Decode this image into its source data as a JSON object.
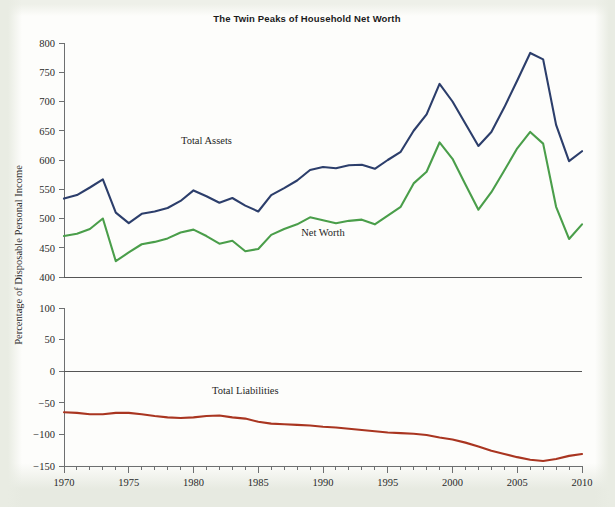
{
  "chart_data": {
    "type": "line",
    "title": "The Twin Peaks of Household Net Worth",
    "xlabel": "",
    "ylabel": "Percentage of Disposable Personal Income",
    "grid": false,
    "legend_position": "inline-annotations",
    "x": [
      1970,
      1971,
      1972,
      1973,
      1974,
      1975,
      1976,
      1977,
      1978,
      1979,
      1980,
      1981,
      1982,
      1983,
      1984,
      1985,
      1986,
      1987,
      1988,
      1989,
      1990,
      1991,
      1992,
      1993,
      1994,
      1995,
      1996,
      1997,
      1998,
      1999,
      2000,
      2001,
      2002,
      2003,
      2004,
      2005,
      2006,
      2007,
      2008,
      2009,
      2010
    ],
    "panels": [
      {
        "name": "upper-panel",
        "ylim": [
          400,
          800
        ],
        "yticks": [
          400,
          450,
          500,
          550,
          600,
          650,
          700,
          750,
          800
        ],
        "series": [
          {
            "name": "Total Assets",
            "color": "#2c3e6b",
            "label_x": 1981,
            "label_y": 628,
            "values": [
              534,
              540,
              553,
              567,
              510,
              492,
              508,
              512,
              518,
              530,
              548,
              538,
              527,
              535,
              522,
              512,
              540,
              552,
              565,
              583,
              588,
              586,
              591,
              592,
              585,
              600,
              614,
              650,
              678,
              730,
              700,
              662,
              624,
              648,
              690,
              736,
              783,
              772,
              660,
              598,
              615
            ],
            "annotations": [
              {
                "label": "1999 peak",
                "x": 1999,
                "y": 730
              },
              {
                "label": "2006 peak",
                "x": 2006,
                "y": 783
              }
            ]
          },
          {
            "name": "Net Worth",
            "color": "#4a9e4a",
            "label_x": 1990,
            "label_y": 470,
            "values": [
              470,
              474,
              482,
              500,
              427,
              442,
              456,
              460,
              466,
              476,
              481,
              470,
              457,
              462,
              444,
              448,
              472,
              482,
              490,
              502,
              497,
              492,
              496,
              498,
              490,
              505,
              520,
              560,
              580,
              630,
              602,
              558,
              515,
              545,
              582,
              620,
              648,
              628,
              520,
              465,
              490
            ],
            "annotations": [
              {
                "label": "1999 peak",
                "x": 1999,
                "y": 630
              },
              {
                "label": "2006 peak",
                "x": 2006,
                "y": 648
              }
            ]
          }
        ]
      },
      {
        "name": "lower-panel",
        "ylim": [
          -150,
          100
        ],
        "yticks": [
          -150,
          -100,
          -50,
          0,
          50,
          100
        ],
        "zero_line": 0,
        "series": [
          {
            "name": "Total Liabilities",
            "color": "#a93520",
            "label_x": 1984,
            "label_y": -36,
            "values": [
              -65,
              -66,
              -68,
              -68,
              -66,
              -66,
              -68,
              -71,
              -73,
              -74,
              -73,
              -71,
              -70,
              -73,
              -75,
              -80,
              -83,
              -84,
              -85,
              -86,
              -88,
              -89,
              -91,
              -93,
              -95,
              -97,
              -98,
              -99,
              -101,
              -105,
              -108,
              -113,
              -119,
              -126,
              -131,
              -136,
              -140,
              -142,
              -139,
              -134,
              -131
            ]
          }
        ]
      }
    ]
  },
  "geometry": {
    "plot_left": 64,
    "plot_right": 582,
    "upper_top": 43,
    "upper_bottom": 277,
    "lower_top": 308,
    "lower_bottom": 466
  }
}
